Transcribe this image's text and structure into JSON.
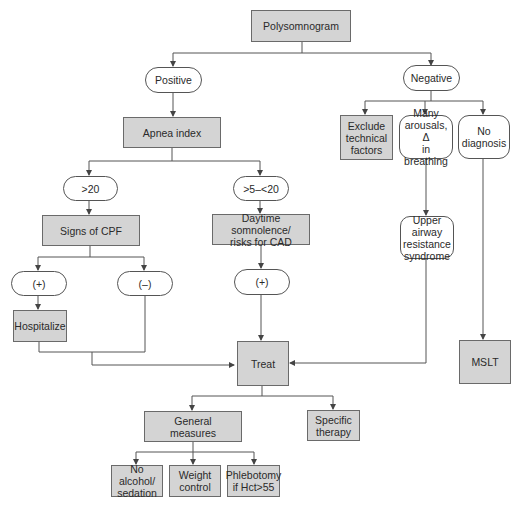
{
  "diagram": {
    "root": "Polysomnogram",
    "positive": "Positive",
    "negative": "Negative",
    "apnea_index": "Apnea index",
    "gt20": ">20",
    "gt5_lt20": ">5–<20",
    "signs_cpf": "Signs of CPF",
    "daytime": "Daytime somnolence/\nrisks for CAD",
    "cpf_plus": "(+)",
    "cpf_minus": "(–)",
    "daytime_plus": "(+)",
    "hospitalize": "Hospitalize",
    "treat": "Treat",
    "exclude": "Exclude\ntechnical\nfactors",
    "many_arousals": "Many\narousals, Δ\nin breathing",
    "no_diagnosis": "No\ndiagnosis",
    "uars": "Upper\nairway\nresistance\nsyndrome",
    "mslt": "MSLT",
    "general_measures": "General\nmeasures",
    "specific_therapy": "Specific\ntherapy",
    "no_alcohol": "No alcohol/\nsedation",
    "weight_control": "Weight\ncontrol",
    "phlebotomy": "Phlebotomy\nif Hct>55"
  },
  "colors": {
    "box_fill": "#d4d4d4",
    "box_border": "#6a6a6a",
    "line": "#555555"
  }
}
